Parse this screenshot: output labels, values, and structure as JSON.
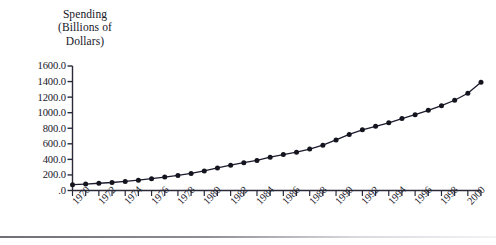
{
  "chart_data": {
    "type": "line",
    "title": "Spending\n(Billions of\nDollars)",
    "title_lines": [
      "Spending",
      "(Billions of",
      "Dollars)"
    ],
    "xlabel": "",
    "ylabel": "Spending (Billions of Dollars)",
    "ylim": [
      0.0,
      1600.0
    ],
    "xlim": [
      1970,
      2001
    ],
    "grid": false,
    "legend": "none",
    "marker": "filled-circle",
    "line_color": "#1b1b2e",
    "marker_color": "#14141f",
    "ytick_labels": [
      "1600.0",
      "1400.0",
      "1200.0",
      "1000.0",
      "800.0",
      "600.0",
      "400.0",
      "200.0",
      ".0"
    ],
    "ytick_values": [
      1600,
      1400,
      1200,
      1000,
      800,
      600,
      400,
      200,
      0
    ],
    "xtick_labels": [
      "1970",
      "1972",
      "1974",
      "1976",
      "1978",
      "1980",
      "1982",
      "1984",
      "1986",
      "1988",
      "1990",
      "1992",
      "1994",
      "1996",
      "1998",
      "2000"
    ],
    "xtick_values": [
      1970,
      1972,
      1974,
      1976,
      1978,
      1980,
      1982,
      1984,
      1986,
      1988,
      1990,
      1992,
      1994,
      1996,
      1998,
      2000
    ],
    "x": [
      1970,
      1971,
      1972,
      1973,
      1974,
      1975,
      1976,
      1977,
      1978,
      1979,
      1980,
      1981,
      1982,
      1983,
      1984,
      1985,
      1986,
      1987,
      1988,
      1989,
      1990,
      1991,
      1992,
      1993,
      1994,
      1995,
      1996,
      1997,
      1998,
      1999,
      2000,
      2001
    ],
    "values": [
      75,
      83,
      93,
      103,
      117,
      133,
      152,
      172,
      194,
      220,
      251,
      290,
      325,
      357,
      387,
      428,
      462,
      493,
      532,
      583,
      650,
      720,
      780,
      825,
      870,
      925,
      975,
      1030,
      1090,
      1160,
      1250,
      1390
    ]
  }
}
